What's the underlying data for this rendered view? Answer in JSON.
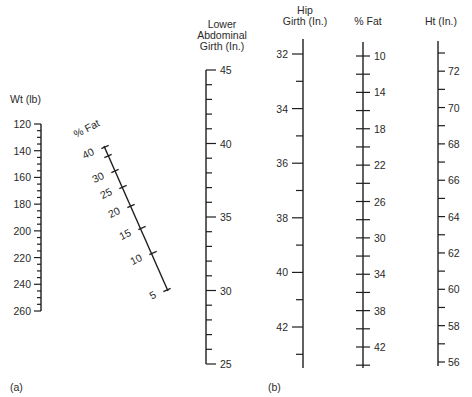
{
  "panels": {
    "a": {
      "label": "(a)",
      "weight_scale": {
        "title": "Wt (lb)",
        "min": 120,
        "max": 260,
        "major_step": 20,
        "minor_step": 5,
        "labels": [
          "120",
          "140",
          "160",
          "180",
          "200",
          "220",
          "240",
          "260"
        ]
      },
      "fat_scale_diagonal": {
        "title": "% Fat",
        "labels": [
          "40",
          "30",
          "25",
          "20",
          "15",
          "10",
          "5"
        ],
        "ticks": [
          40,
          35,
          30,
          25,
          20,
          15,
          10,
          5
        ]
      },
      "lower_abdominal_scale": {
        "title_lines": [
          "Lower",
          "Abdominal",
          "Girth (In.)"
        ],
        "min": 25,
        "max": 45,
        "major_step": 5,
        "minor_step": 1,
        "labels": [
          "45",
          "40",
          "35",
          "30",
          "25"
        ]
      }
    },
    "b": {
      "label": "(b)",
      "hip_girth_scale": {
        "title_lines": [
          "Hip",
          "Girth (In.)"
        ],
        "min": 32,
        "max": 43,
        "major_step": 2,
        "minor_step": 1,
        "labels": [
          "32",
          "34",
          "36",
          "38",
          "40",
          "42"
        ]
      },
      "fat_scale": {
        "title": "% Fat",
        "min": 10,
        "max": 44,
        "tick_step": 2,
        "labels": [
          "10",
          "14",
          "18",
          "22",
          "26",
          "30",
          "34",
          "38",
          "42"
        ]
      },
      "height_scale": {
        "title": "Ht (In.)",
        "min": 56,
        "max": 73,
        "major_step": 2,
        "minor_step": 1,
        "labels": [
          "72",
          "70",
          "68",
          "66",
          "64",
          "62",
          "60",
          "58",
          "56"
        ]
      }
    }
  },
  "chart_data": {
    "type": "nomogram",
    "title": "",
    "panels": [
      {
        "id": "a",
        "scales": [
          {
            "name": "Wt (lb)",
            "range": [
              120,
              260
            ],
            "ticks_labeled": [
              120,
              140,
              160,
              180,
              200,
              220,
              240,
              260
            ],
            "minor_step": 5,
            "orientation": "vertical"
          },
          {
            "name": "% Fat",
            "range": [
              5,
              40
            ],
            "ticks_labeled": [
              40,
              30,
              25,
              20,
              15,
              10,
              5
            ],
            "orientation": "diagonal",
            "note": "non-linear spacing"
          },
          {
            "name": "Lower Abdominal Girth (In.)",
            "range": [
              25,
              45
            ],
            "ticks_labeled": [
              45,
              40,
              35,
              30,
              25
            ],
            "minor_step": 1,
            "orientation": "vertical"
          }
        ]
      },
      {
        "id": "b",
        "scales": [
          {
            "name": "Hip Girth (In.)",
            "range": [
              32,
              43
            ],
            "ticks_labeled": [
              32,
              34,
              36,
              38,
              40,
              42
            ],
            "minor_step": 1,
            "orientation": "vertical"
          },
          {
            "name": "% Fat",
            "range": [
              10,
              44
            ],
            "ticks_labeled": [
              10,
              14,
              18,
              22,
              26,
              30,
              34,
              38,
              42
            ],
            "minor_step": 2,
            "orientation": "vertical"
          },
          {
            "name": "Ht (In.)",
            "range": [
              56,
              73
            ],
            "ticks_labeled": [
              72,
              70,
              68,
              66,
              64,
              62,
              60,
              58,
              56
            ],
            "minor_step": 1,
            "orientation": "vertical"
          }
        ]
      }
    ]
  }
}
